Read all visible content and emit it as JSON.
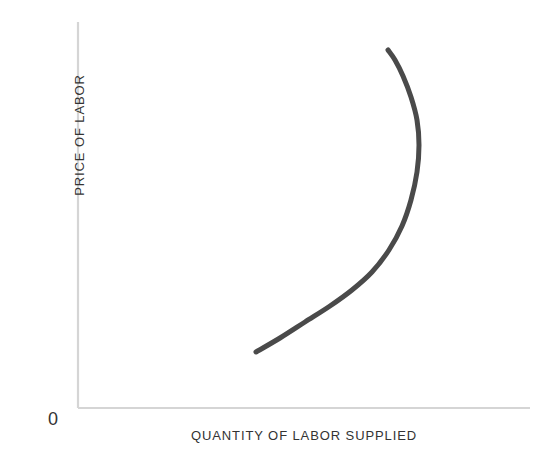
{
  "figure": {
    "background_color": "#ffffff",
    "width": 556,
    "height": 473
  },
  "axes": {
    "color": "#d5d5d5",
    "origin_label": "0",
    "y_axis": {
      "x": 78,
      "y_top": 22,
      "y_bottom": 408
    },
    "x_axis": {
      "y": 408,
      "x_left": 78,
      "x_right": 530
    }
  },
  "labels": {
    "y_axis_label": "PRICE OF LABOR",
    "x_axis_label": "QUANTITY OF LABOR SUPPLIED"
  },
  "chart_data": {
    "type": "line",
    "title": "",
    "subtitle": "",
    "xlabel": "QUANTITY OF LABOR SUPPLIED",
    "ylabel": "PRICE OF LABOR",
    "xlim": [
      0,
      1
    ],
    "ylim": [
      0,
      1
    ],
    "grid": false,
    "legend": null,
    "legend_position": "none",
    "annotations": [
      {
        "text": "0",
        "x_px": 55,
        "y_px": 420,
        "role": "origin-marker"
      }
    ],
    "series": [
      {
        "name": "Backward-bending labor supply curve",
        "color": "#4a4a4a",
        "line_width": 5,
        "shape": "backward-bending",
        "description": "Labor supply rises with price of labor up to a maximum quantity, then bends back to the left as the price of labor continues to rise.",
        "points_px": [
          {
            "x": 256,
            "y": 352
          },
          {
            "x": 280,
            "y": 338
          },
          {
            "x": 305,
            "y": 322
          },
          {
            "x": 330,
            "y": 306
          },
          {
            "x": 352,
            "y": 290
          },
          {
            "x": 372,
            "y": 272
          },
          {
            "x": 389,
            "y": 250
          },
          {
            "x": 402,
            "y": 226
          },
          {
            "x": 411,
            "y": 200
          },
          {
            "x": 417,
            "y": 172
          },
          {
            "x": 419,
            "y": 145
          },
          {
            "x": 417,
            "y": 120
          },
          {
            "x": 411,
            "y": 97
          },
          {
            "x": 403,
            "y": 76
          },
          {
            "x": 395,
            "y": 60
          },
          {
            "x": 388,
            "y": 50
          }
        ],
        "points_data": [
          {
            "x": 0.394,
            "y": 0.145
          },
          {
            "x": 0.447,
            "y": 0.181
          },
          {
            "x": 0.502,
            "y": 0.223
          },
          {
            "x": 0.558,
            "y": 0.264
          },
          {
            "x": 0.606,
            "y": 0.306
          },
          {
            "x": 0.65,
            "y": 0.352
          },
          {
            "x": 0.688,
            "y": 0.409
          },
          {
            "x": 0.717,
            "y": 0.472
          },
          {
            "x": 0.737,
            "y": 0.539
          },
          {
            "x": 0.75,
            "y": 0.611
          },
          {
            "x": 0.754,
            "y": 0.681
          },
          {
            "x": 0.75,
            "y": 0.746
          },
          {
            "x": 0.737,
            "y": 0.805
          },
          {
            "x": 0.719,
            "y": 0.86
          },
          {
            "x": 0.701,
            "y": 0.901
          },
          {
            "x": 0.686,
            "y": 0.927
          }
        ],
        "key_points": {
          "start": {
            "x_px": 256,
            "y_px": 352
          },
          "max_quantity": {
            "x_px": 419,
            "y_px": 145
          },
          "end": {
            "x_px": 388,
            "y_px": 50
          }
        }
      }
    ]
  }
}
